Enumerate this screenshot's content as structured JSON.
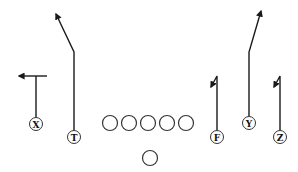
{
  "diagram": {
    "type": "football-play",
    "colors": {
      "line": "#1a1a1a",
      "circle_stroke": "#333333",
      "background": "#ffffff"
    },
    "offensive_line": [
      {
        "cx": 110,
        "cy": 123
      },
      {
        "cx": 129,
        "cy": 123
      },
      {
        "cx": 148,
        "cy": 123
      },
      {
        "cx": 167,
        "cy": 123
      },
      {
        "cx": 186,
        "cy": 123
      }
    ],
    "quarterback": {
      "cx": 150,
      "cy": 158
    },
    "receivers": [
      {
        "label": "X",
        "cx": 36,
        "cy": 124,
        "route": "out",
        "route_label": "Out (left)"
      },
      {
        "label": "T",
        "cx": 74,
        "cy": 137,
        "route": "post-corner",
        "route_label": "Vertical then angle left"
      },
      {
        "label": "F",
        "cx": 217,
        "cy": 137,
        "route": "comeback",
        "route_label": "Vertical hook back"
      },
      {
        "label": "Y",
        "cx": 249,
        "cy": 123,
        "route": "seam-angle",
        "route_label": "Vertical then angle right"
      },
      {
        "label": "Z",
        "cx": 280,
        "cy": 137,
        "route": "comeback",
        "route_label": "Vertical hook back"
      }
    ]
  }
}
